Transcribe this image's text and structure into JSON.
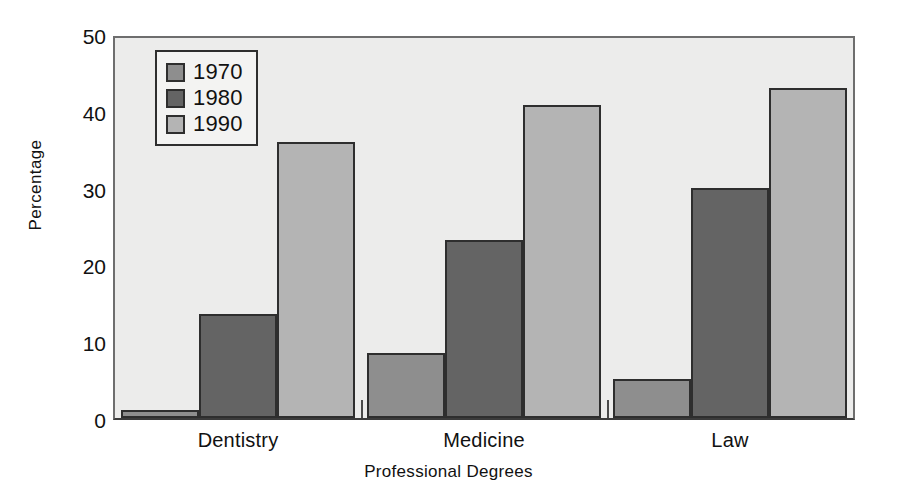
{
  "chart_data": {
    "type": "bar",
    "title": "",
    "xlabel": "Professional Degrees",
    "ylabel": "Percentage",
    "categories": [
      "Dentistry",
      "Medicine",
      "Law"
    ],
    "series": [
      {
        "name": "1970",
        "color": "#8e8e8e",
        "values": [
          1.0,
          8.5,
          5.1
        ]
      },
      {
        "name": "1980",
        "color": "#646464",
        "values": [
          13.5,
          23.2,
          30.0
        ]
      },
      {
        "name": "1990",
        "color": "#b4b4b4",
        "values": [
          36.0,
          40.8,
          43.0
        ]
      }
    ],
    "ylim": [
      0,
      50
    ],
    "yticks": [
      0,
      10,
      20,
      30,
      40,
      50
    ],
    "ytick_labels": [
      "0",
      "10",
      "20",
      "30",
      "40",
      "50"
    ],
    "grid": false,
    "legend_position": "upper left",
    "plot_background": "#ececeb",
    "axis_color": "#2e2e2e",
    "bar_edge_color": "#2e2e2e"
  },
  "legend": {
    "entries": [
      {
        "label": "1970"
      },
      {
        "label": "1980"
      },
      {
        "label": "1990"
      }
    ]
  },
  "axes": {
    "y_title": "Percentage",
    "x_title": "Professional Degrees"
  }
}
